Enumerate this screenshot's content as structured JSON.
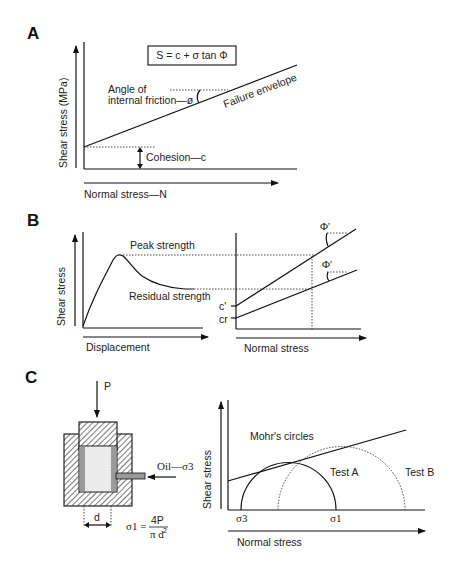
{
  "panels": {
    "A": {
      "label": "A",
      "formula": "S = c + σ tan Φ",
      "y_axis_label": "Shear stress (MPa)",
      "x_axis_label": "Normal stress—N",
      "angle_label_line1": "Angle of",
      "angle_label_line2": "internal friction—ø",
      "envelope_label": "Failure envelope",
      "cohesion_label": "Cohesion—c"
    },
    "B": {
      "label": "B",
      "left_y_axis_label": "Shear stress",
      "left_x_axis_label": "Displacement",
      "peak_label": "Peak strength",
      "residual_label": "Residual strength",
      "right_x_axis_label": "Normal stress",
      "c_prime_label": "c'",
      "cr_label": "cr",
      "phi_upper_label": "Φ'",
      "phi_lower_label": "Φ'"
    },
    "C": {
      "label": "C",
      "load_label": "P",
      "oil_label": "Oil—σ3",
      "diameter_label": "d",
      "sigma1_lhs": "σ1 =",
      "sigma1_num": "4P",
      "sigma1_den": "π d",
      "sigma1_den_exp": "2",
      "y_axis_label": "Shear stress",
      "x_axis_label": "Normal stress",
      "mohr_label": "Mohr's circles",
      "test_a_label": "Test A",
      "test_b_label": "Test B",
      "sigma3_tick": "σ3",
      "sigma1_tick": "σ1"
    }
  },
  "colors": {
    "ink": "#111111",
    "membrane": "#9a9a9a",
    "sample": "#e8e8e8",
    "background": "#ffffff"
  }
}
